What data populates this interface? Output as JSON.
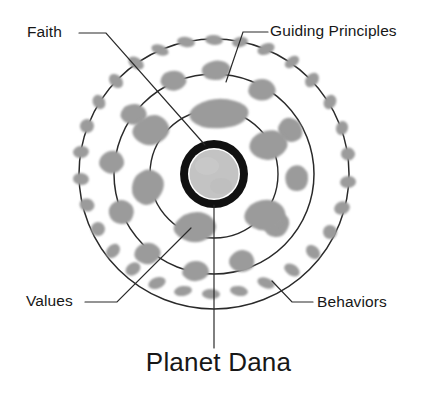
{
  "diagram": {
    "title": "Planet Dana",
    "type": "concentric-orbit-diagram",
    "core": {
      "name": "planet-core",
      "ring_color": "#111111",
      "body_color": "#c3c3c3"
    },
    "labels": {
      "faith": "Faith",
      "guiding_principles": "Guiding Principles",
      "values": "Values",
      "behaviors": "Behaviors",
      "planet_dana": "Planet Dana"
    },
    "orbits": [
      {
        "name": "inner-orbit",
        "label": "Faith",
        "radius": 64
      },
      {
        "name": "middle-orbit",
        "label": "Values",
        "radius": 100
      },
      {
        "name": "outer-orbit",
        "label": "Behaviors",
        "radius": 135
      }
    ],
    "colors": {
      "background": "#ffffff",
      "orbit_stroke": "#2a2a2a",
      "leader_line": "#2a2a2a",
      "blob_fill": "#9b9b9b",
      "core_ring": "#111111",
      "core_body": "#c3c3c3",
      "text": "#171717"
    }
  }
}
